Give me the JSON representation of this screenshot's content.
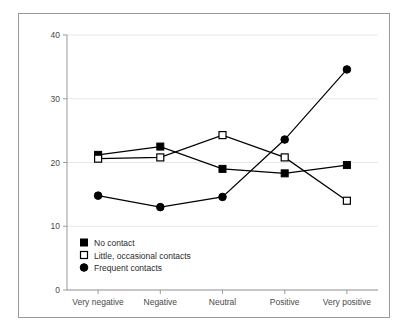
{
  "chart_data": {
    "type": "line",
    "title": "",
    "subtitle": "",
    "xlabel": "",
    "ylabel": "",
    "categories": [
      "Very negative",
      "Negative",
      "Neutral",
      "Positive",
      "Very positive"
    ],
    "series": [
      {
        "name": "No contact",
        "marker": "filled-square",
        "color": "#000000",
        "values": [
          21.2,
          22.5,
          19.0,
          18.3,
          19.6
        ]
      },
      {
        "name": "Little, occasional contacts",
        "marker": "open-square",
        "color": "#000000",
        "values": [
          20.6,
          20.8,
          24.3,
          20.8,
          14.0
        ]
      },
      {
        "name": "Frequent contacts",
        "marker": "filled-circle",
        "color": "#000000",
        "values": [
          14.8,
          13.0,
          14.6,
          23.6,
          34.6
        ]
      }
    ],
    "ylim": [
      0,
      40
    ],
    "yticks": [
      0,
      10,
      20,
      30,
      40
    ],
    "ytick_labels": [
      "0",
      "10",
      "20",
      "30",
      "40"
    ],
    "grid": true,
    "grid_color": "#e8e8e8",
    "axis_color": "#9a9a9a",
    "legend_position": "inside-lower-left",
    "legend_entries": [
      "No contact",
      "Little, occasional contacts",
      "Frequent contacts"
    ]
  },
  "figure": {
    "border_color": "#9a9a9a",
    "background": "#ffffff"
  }
}
